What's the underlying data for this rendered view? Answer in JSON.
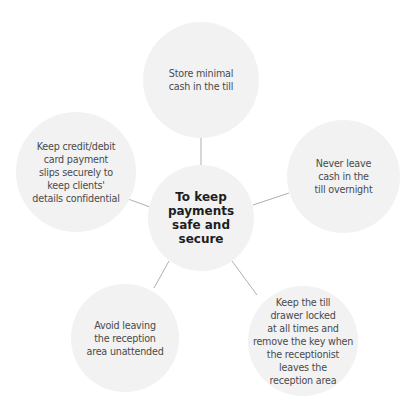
{
  "diagram": {
    "type": "mind-map",
    "colors": {
      "node_fill": "#f2f2f2",
      "connector": "#9a9a9a",
      "center_text": "#1e1e1e",
      "node_text": "#4a4a4a"
    },
    "center": {
      "label": "To keep\npayments\nsafe and\nsecure"
    },
    "nodes": [
      {
        "id": "top",
        "label": "Store minimal\ncash in the till"
      },
      {
        "id": "right",
        "label": "Never leave\ncash in the\ntill overnight"
      },
      {
        "id": "bottom-right",
        "label": "Keep the till\ndrawer locked\nat all times and\nremove the key when\nthe receptionist\nleaves the\nreception area"
      },
      {
        "id": "bottom-left",
        "label": "Avoid leaving\nthe reception\narea unattended"
      },
      {
        "id": "left",
        "label": "Keep credit/debit\ncard payment\nslips securely to\nkeep clients'\ndetails confidential"
      }
    ]
  }
}
